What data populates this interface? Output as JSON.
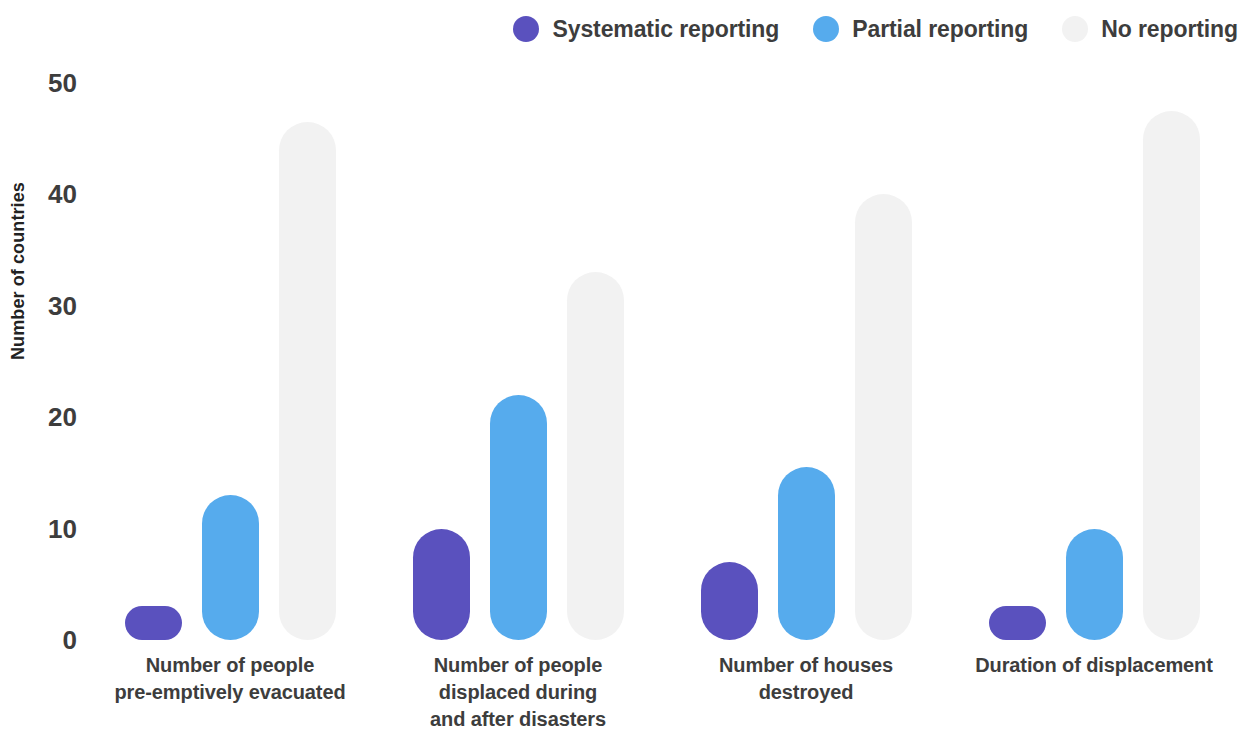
{
  "legend": {
    "items": [
      {
        "label": "Systematic reporting",
        "color": "#5a51be",
        "icon": "circle-swatch-icon"
      },
      {
        "label": "Partial reporting",
        "color": "#56abed",
        "icon": "circle-swatch-icon"
      },
      {
        "label": "No reporting",
        "color": "#f2f2f2",
        "icon": "circle-swatch-icon"
      }
    ]
  },
  "axes": {
    "y_title": "Number of countries",
    "y_ticks": [
      "0",
      "10",
      "20",
      "30",
      "40",
      "50"
    ]
  },
  "categories": [
    {
      "lines": [
        "Number of people",
        "pre-emptively evacuated"
      ]
    },
    {
      "lines": [
        "Number of people",
        "displaced during",
        "and after disasters"
      ]
    },
    {
      "lines": [
        "Number of houses",
        "destroyed"
      ]
    },
    {
      "lines": [
        "Duration of displacement"
      ]
    }
  ],
  "chart_data": {
    "type": "bar",
    "title": "",
    "xlabel": "",
    "ylabel": "Number of countries",
    "ylim": [
      0,
      50
    ],
    "yticks": [
      0,
      10,
      20,
      30,
      40,
      50
    ],
    "grid": false,
    "legend_position": "top-right",
    "categories": [
      "Number of people pre-emptively evacuated",
      "Number of people displaced during and after disasters",
      "Number of houses destroyed",
      "Duration of displacement"
    ],
    "series": [
      {
        "name": "Systematic reporting",
        "color": "#5a51be",
        "values": [
          3,
          10,
          7,
          3
        ]
      },
      {
        "name": "Partial reporting",
        "color": "#56abed",
        "values": [
          13,
          22,
          15.5,
          10
        ]
      },
      {
        "name": "No reporting",
        "color": "#f2f2f2",
        "values": [
          46.5,
          33,
          40,
          47.5
        ]
      }
    ]
  }
}
